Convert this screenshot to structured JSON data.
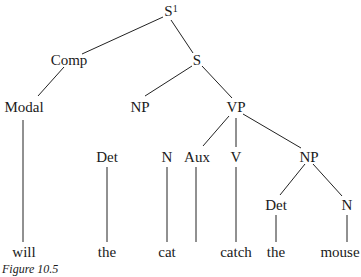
{
  "figure": {
    "caption": "Figure 10.5",
    "line_color": "#222222"
  },
  "nodes": {
    "s_bar": {
      "label": "S",
      "superscript": "1"
    },
    "comp": {
      "label": "Comp"
    },
    "s": {
      "label": "S"
    },
    "modal": {
      "label": "Modal"
    },
    "np_subj": {
      "label": "NP"
    },
    "vp": {
      "label": "VP"
    },
    "det_subj": {
      "label": "Det"
    },
    "n_subj": {
      "label": "N"
    },
    "aux": {
      "label": "Aux"
    },
    "v": {
      "label": "V"
    },
    "np_obj": {
      "label": "NP"
    },
    "det_obj": {
      "label": "Det"
    },
    "n_obj": {
      "label": "N"
    }
  },
  "leaves": {
    "will": "will",
    "the_subj": "the",
    "cat": "cat",
    "catch": "catch",
    "the_obj": "the",
    "mouse": "mouse"
  }
}
